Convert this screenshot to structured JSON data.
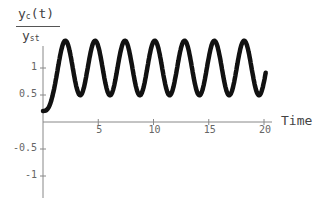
{
  "chart_data": {
    "type": "line",
    "title": "",
    "ylabel_num": "y",
    "ylabel_num_sub": "c",
    "ylabel_num_arg": "(t)",
    "ylabel_den": "y",
    "ylabel_den_sub": "st",
    "xlabel": "Time",
    "xlim": [
      0,
      20.2
    ],
    "ylim": [
      -1.35,
      1.35
    ],
    "xticks": [
      5,
      10,
      15,
      20
    ],
    "xtick_labels": [
      "5",
      "10",
      "15",
      "20"
    ],
    "yticks": [
      1,
      0.5,
      -0.5,
      -1
    ],
    "ytick_labels": [
      "1",
      "0.5",
      "-0.5",
      "-1"
    ],
    "grid": false,
    "legend": null,
    "series": [
      {
        "name": "y_c(t)/y_st",
        "model": "ramped-step undamped oscillator",
        "omega": 2.33,
        "ramp_time": 1.35,
        "peak_amplitude": 1.3,
        "first_peak": {
          "t": 1.3,
          "y": 1.05
        },
        "end": {
          "t": 20.2,
          "y": 1.1
        }
      }
    ]
  }
}
